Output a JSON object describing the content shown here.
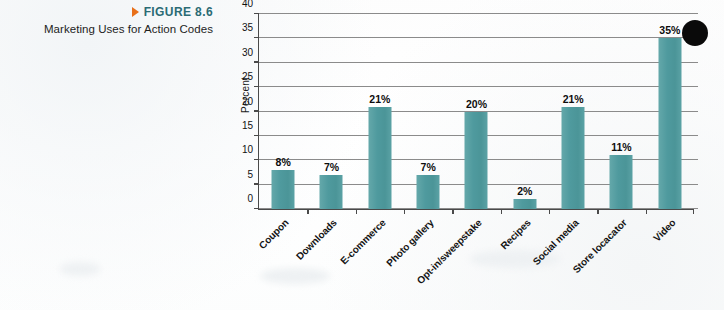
{
  "caption": {
    "figure_number": "FIGURE 8.6",
    "subtitle": "Marketing Uses for Action Codes",
    "marker_icon": "triangle-right-icon",
    "figure_number_color": "#2b6b74",
    "marker_color": "#e8701a"
  },
  "chart_data": {
    "type": "bar",
    "title": "Marketing Uses for Action Codes",
    "xlabel": "",
    "ylabel": "Percent",
    "ylim": [
      0,
      40
    ],
    "ytick_step": 5,
    "yticks": [
      "40",
      "35",
      "30",
      "25",
      "20",
      "15",
      "10",
      "5",
      "0"
    ],
    "grid": true,
    "legend": "none",
    "bar_color": "#4f9a9e",
    "value_suffix": "%",
    "categories": [
      "Coupon",
      "Downloads",
      "E-commerce",
      "Photo gallery",
      "Opt-in/sweepstake",
      "Recipes",
      "Social media",
      "Store locacator",
      "Video"
    ],
    "values": [
      8,
      7,
      21,
      7,
      20,
      2,
      21,
      11,
      35
    ],
    "value_labels": [
      "8%",
      "7%",
      "21%",
      "7%",
      "20%",
      "2%",
      "21%",
      "11%",
      "35%"
    ]
  }
}
